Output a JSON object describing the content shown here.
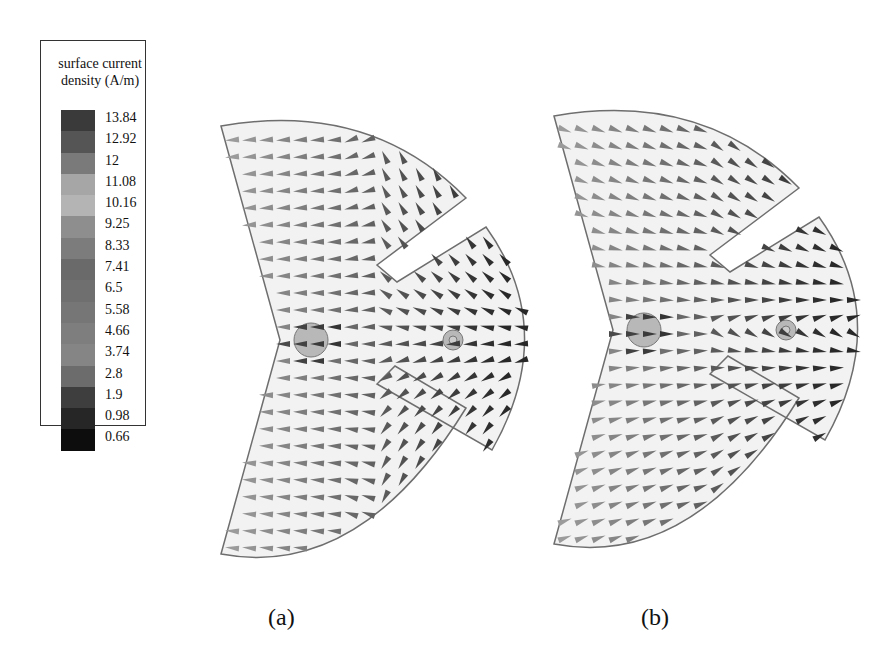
{
  "legend": {
    "title_line1": "surface current",
    "title_line2": "density (A/m)",
    "levels": [
      {
        "label": "13.84",
        "color": "#3a3a3a"
      },
      {
        "label": "12.92",
        "color": "#555555"
      },
      {
        "label": "12",
        "color": "#7a7a7a"
      },
      {
        "label": "11.08",
        "color": "#a6a6a6"
      },
      {
        "label": "10.16",
        "color": "#b4b4b4"
      },
      {
        "label": "9.25",
        "color": "#8e8e8e"
      },
      {
        "label": "8.33",
        "color": "#7c7c7c"
      },
      {
        "label": "7.41",
        "color": "#6a6a6a"
      },
      {
        "label": "6.5",
        "color": "#6f6f6f"
      },
      {
        "label": "5.58",
        "color": "#767676"
      },
      {
        "label": "4.66",
        "color": "#7e7e7e"
      },
      {
        "label": "3.74",
        "color": "#858585"
      },
      {
        "label": "2.8",
        "color": "#6c6c6c"
      },
      {
        "label": "1.9",
        "color": "#3e3e3e"
      },
      {
        "label": "0.98",
        "color": "#262626"
      },
      {
        "label": "0.66",
        "color": "#0d0d0d"
      }
    ]
  },
  "panels": [
    {
      "id": "a",
      "caption": "(a)",
      "dominant_flow": "leftward (-x)"
    },
    {
      "id": "b",
      "caption": "(b)",
      "dominant_flow": "rightward (+x)"
    }
  ],
  "colors": {
    "patch_fill": "#f2f2f2",
    "patch_outline": "#6e6e6e",
    "feed_fill": "#b8b8b8",
    "arrow_light": "#9a9a9a",
    "arrow_dark": "#2c2c2c"
  }
}
